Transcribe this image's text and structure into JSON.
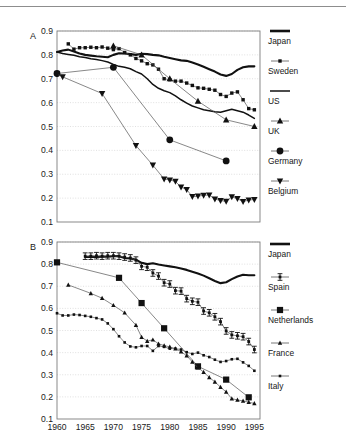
{
  "figure": {
    "background": "#ffffff",
    "axis_color": "#7d7d7d",
    "grid_color": "#d8d8d8",
    "ink": "#111111"
  },
  "panels": [
    {
      "id": "A",
      "label": "A",
      "chart_data": {
        "type": "line",
        "title": "",
        "xlabel": "",
        "ylabel": "",
        "xlim": [
          1960,
          1996
        ],
        "ylim": [
          0.1,
          0.9
        ],
        "xticks": [
          1960,
          1965,
          1970,
          1975,
          1980,
          1985,
          1990,
          1995
        ],
        "yticks": [
          0.1,
          0.2,
          0.3,
          0.4,
          0.5,
          0.6,
          0.7,
          0.8,
          0.9
        ],
        "grid": true,
        "legend_position": "right",
        "series": [
          {
            "name": "Japan",
            "marker": "none",
            "line": "thick",
            "color": "#111111",
            "x": [
              1960,
              1961,
              1962,
              1963,
              1964,
              1965,
              1966,
              1967,
              1968,
              1969,
              1970,
              1971,
              1972,
              1973,
              1974,
              1975,
              1976,
              1977,
              1978,
              1979,
              1980,
              1981,
              1982,
              1983,
              1984,
              1985,
              1986,
              1987,
              1988,
              1989,
              1990,
              1991,
              1992,
              1993,
              1994,
              1995
            ],
            "y": [
              0.812,
              0.818,
              0.822,
              0.814,
              0.806,
              0.8,
              0.797,
              0.794,
              0.792,
              0.79,
              0.8,
              0.807,
              0.806,
              0.803,
              0.8,
              0.805,
              0.803,
              0.8,
              0.798,
              0.792,
              0.787,
              0.782,
              0.777,
              0.775,
              0.768,
              0.76,
              0.75,
              0.74,
              0.73,
              0.718,
              0.712,
              0.72,
              0.737,
              0.748,
              0.752,
              0.752
            ]
          },
          {
            "name": "Sweden",
            "marker": "square-small",
            "line": "thin",
            "color": "#111111",
            "x": [
              1962,
              1963,
              1964,
              1965,
              1966,
              1967,
              1968,
              1969,
              1970,
              1971,
              1972,
              1973,
              1974,
              1975,
              1976,
              1977,
              1978,
              1979,
              1980,
              1981,
              1982,
              1983,
              1984,
              1985,
              1986,
              1987,
              1988,
              1989,
              1990,
              1991,
              1992,
              1993,
              1994,
              1995
            ],
            "y": [
              0.846,
              0.824,
              0.83,
              0.83,
              0.832,
              0.83,
              0.833,
              0.828,
              0.822,
              0.826,
              0.81,
              0.8,
              0.785,
              0.775,
              0.763,
              0.758,
              0.74,
              0.7,
              0.696,
              0.69,
              0.69,
              0.682,
              0.672,
              0.662,
              0.66,
              0.656,
              0.652,
              0.634,
              0.626,
              0.64,
              0.645,
              0.612,
              0.575,
              0.57
            ]
          },
          {
            "name": "US",
            "marker": "none",
            "line": "medium",
            "color": "#111111",
            "x": [
              1960,
              1961,
              1962,
              1963,
              1964,
              1965,
              1966,
              1967,
              1968,
              1969,
              1970,
              1971,
              1972,
              1973,
              1974,
              1975,
              1976,
              1977,
              1978,
              1979,
              1980,
              1981,
              1982,
              1983,
              1984,
              1985,
              1986,
              1987,
              1988,
              1989,
              1990,
              1991,
              1992,
              1993,
              1994,
              1995
            ],
            "y": [
              0.812,
              0.806,
              0.802,
              0.798,
              0.792,
              0.789,
              0.784,
              0.781,
              0.776,
              0.77,
              0.76,
              0.752,
              0.748,
              0.742,
              0.73,
              0.72,
              0.7,
              0.676,
              0.66,
              0.65,
              0.642,
              0.628,
              0.612,
              0.598,
              0.586,
              0.578,
              0.57,
              0.566,
              0.562,
              0.56,
              0.566,
              0.572,
              0.566,
              0.56,
              0.548,
              0.534
            ]
          },
          {
            "name": "UK",
            "marker": "triangle-up",
            "line": "thin",
            "color": "#111111",
            "x": [
              1970,
              1975,
              1980,
              1985,
              1990,
              1995
            ],
            "y": [
              0.838,
              0.8,
              0.7,
              0.606,
              0.528,
              0.5
            ]
          },
          {
            "name": "Germany",
            "marker": "circle",
            "line": "thin",
            "color": "#111111",
            "x": [
              1960,
              1970,
              1980,
              1990
            ],
            "y": [
              0.722,
              0.748,
              0.444,
              0.356
            ]
          },
          {
            "name": "Belgium",
            "marker": "triangle-down",
            "line": "thin",
            "color": "#111111",
            "x": [
              1960,
              1961,
              1968,
              1974,
              1977,
              1979,
              1980,
              1981,
              1982,
              1983,
              1984,
              1985,
              1986,
              1987,
              1988,
              1989,
              1990,
              1991,
              1992,
              1993,
              1994,
              1995
            ],
            "y": [
              0.72,
              0.708,
              0.638,
              0.42,
              0.338,
              0.28,
              0.276,
              0.27,
              0.246,
              0.236,
              0.206,
              0.208,
              0.212,
              0.213,
              0.196,
              0.19,
              0.186,
              0.205,
              0.198,
              0.185,
              0.192,
              0.194
            ]
          }
        ]
      },
      "legend": [
        {
          "label": "Japan",
          "key": "thick-line"
        },
        {
          "label": "Sweden",
          "key": "square-small"
        },
        {
          "label": "US",
          "key": "medium-line"
        },
        {
          "label": "UK",
          "key": "triangle-up"
        },
        {
          "label": "Germany",
          "key": "circle"
        },
        {
          "label": "Belgium",
          "key": "triangle-down"
        }
      ]
    },
    {
      "id": "B",
      "label": "B",
      "chart_data": {
        "type": "line",
        "title": "",
        "xlabel": "",
        "ylabel": "",
        "xlim": [
          1960,
          1996
        ],
        "ylim": [
          0.1,
          0.9
        ],
        "xticks": [
          1960,
          1965,
          1970,
          1975,
          1980,
          1985,
          1990,
          1995
        ],
        "yticks": [
          0.1,
          0.2,
          0.3,
          0.4,
          0.5,
          0.6,
          0.7,
          0.8,
          0.9
        ],
        "grid": true,
        "legend_position": "right",
        "series": [
          {
            "name": "Japan",
            "marker": "none",
            "line": "thick",
            "color": "#111111",
            "x": [
              1965,
              1966,
              1967,
              1968,
              1969,
              1970,
              1971,
              1972,
              1973,
              1974,
              1975,
              1976,
              1977,
              1978,
              1979,
              1980,
              1981,
              1982,
              1983,
              1984,
              1985,
              1986,
              1987,
              1988,
              1989,
              1990,
              1991,
              1992,
              1993,
              1994,
              1995
            ],
            "y": [
              0.832,
              0.834,
              0.832,
              0.834,
              0.833,
              0.836,
              0.836,
              0.828,
              0.826,
              0.82,
              0.806,
              0.8,
              0.804,
              0.798,
              0.794,
              0.79,
              0.786,
              0.78,
              0.774,
              0.766,
              0.758,
              0.748,
              0.736,
              0.724,
              0.714,
              0.718,
              0.732,
              0.744,
              0.752,
              0.75,
              0.75
            ]
          },
          {
            "name": "Spain",
            "marker": "cross-square",
            "line": "thin",
            "color": "#111111",
            "x": [
              1965,
              1966,
              1967,
              1968,
              1969,
              1970,
              1971,
              1972,
              1973,
              1974,
              1975,
              1976,
              1977,
              1978,
              1979,
              1980,
              1981,
              1982,
              1983,
              1984,
              1985,
              1986,
              1987,
              1988,
              1989,
              1990,
              1991,
              1992,
              1993,
              1994,
              1995
            ],
            "y": [
              0.836,
              0.836,
              0.838,
              0.836,
              0.838,
              0.838,
              0.836,
              0.832,
              0.828,
              0.818,
              0.79,
              0.786,
              0.76,
              0.746,
              0.716,
              0.71,
              0.68,
              0.678,
              0.644,
              0.632,
              0.628,
              0.588,
              0.58,
              0.562,
              0.54,
              0.498,
              0.48,
              0.476,
              0.472,
              0.45,
              0.414
            ]
          },
          {
            "name": "Netherlands",
            "marker": "square-large",
            "line": "thin",
            "color": "#111111",
            "x": [
              1960,
              1971,
              1975,
              1979,
              1985,
              1990,
              1994
            ],
            "y": [
              0.808,
              0.738,
              0.624,
              0.51,
              0.338,
              0.278,
              0.198
            ]
          },
          {
            "name": "France",
            "marker": "triangle-up-small",
            "line": "thin",
            "color": "#111111",
            "x": [
              1962,
              1966,
              1968,
              1970,
              1972,
              1974,
              1975,
              1976,
              1977,
              1978,
              1979,
              1980,
              1981,
              1982,
              1983,
              1984,
              1985,
              1986,
              1987,
              1988,
              1989,
              1990,
              1991,
              1992,
              1993,
              1994,
              1995
            ],
            "y": [
              0.706,
              0.668,
              0.646,
              0.614,
              0.58,
              0.524,
              0.47,
              0.452,
              0.458,
              0.44,
              0.432,
              0.426,
              0.418,
              0.404,
              0.386,
              0.358,
              0.332,
              0.312,
              0.288,
              0.268,
              0.244,
              0.222,
              0.192,
              0.186,
              0.182,
              0.176,
              0.17
            ]
          },
          {
            "name": "Italy",
            "marker": "dot-small",
            "line": "thin",
            "color": "#111111",
            "x": [
              1960,
              1961,
              1962,
              1963,
              1964,
              1965,
              1966,
              1967,
              1968,
              1969,
              1970,
              1971,
              1972,
              1973,
              1974,
              1975,
              1976,
              1977,
              1978,
              1979,
              1980,
              1981,
              1982,
              1983,
              1984,
              1985,
              1986,
              1987,
              1988,
              1989,
              1990,
              1991,
              1992,
              1993,
              1994,
              1995
            ],
            "y": [
              0.578,
              0.568,
              0.568,
              0.572,
              0.57,
              0.566,
              0.562,
              0.556,
              0.55,
              0.532,
              0.506,
              0.474,
              0.446,
              0.428,
              0.424,
              0.43,
              0.43,
              0.408,
              0.43,
              0.426,
              0.418,
              0.418,
              0.414,
              0.402,
              0.394,
              0.4,
              0.388,
              0.38,
              0.368,
              0.358,
              0.362,
              0.37,
              0.372,
              0.356,
              0.34,
              0.318
            ]
          }
        ]
      },
      "legend": [
        {
          "label": "Japan",
          "key": "thick-line"
        },
        {
          "label": "Spain",
          "key": "cross-square"
        },
        {
          "label": "Netherlands",
          "key": "square-large"
        },
        {
          "label": "France",
          "key": "triangle-up-small"
        },
        {
          "label": "Italy",
          "key": "dot-small"
        }
      ]
    }
  ]
}
